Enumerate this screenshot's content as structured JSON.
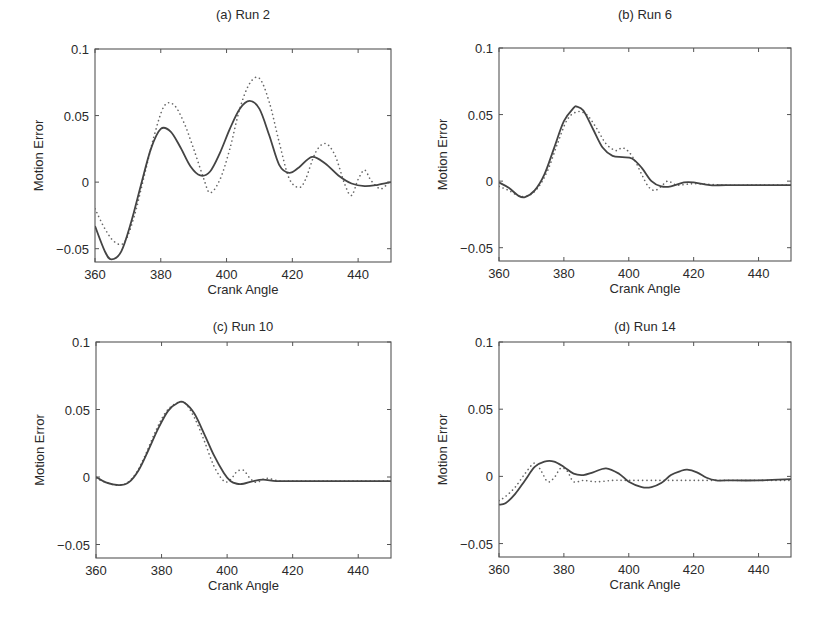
{
  "figure": {
    "panels": [
      {
        "id": "a",
        "title": "(a) Run 2"
      },
      {
        "id": "b",
        "title": "(b) Run 6"
      },
      {
        "id": "c",
        "title": "(c) Run 10"
      },
      {
        "id": "d",
        "title": "(d) Run 14"
      }
    ]
  },
  "chart_data": [
    {
      "type": "line",
      "title": "(a) Run 2",
      "xlabel": "Crank Angle",
      "ylabel": "Motion Error",
      "xlim": [
        360,
        450
      ],
      "ylim": [
        -0.06,
        0.1
      ],
      "xticks": [
        360,
        380,
        400,
        420,
        440
      ],
      "yticks": [
        -0.05,
        0,
        0.05,
        0.1
      ],
      "ytick_labels": [
        "-0.05",
        "0",
        "0.05",
        "0.1"
      ],
      "grid": false,
      "series": [
        {
          "name": "solid",
          "style": "solid",
          "x": [
            360,
            363,
            365,
            368,
            371,
            374,
            377,
            380,
            383,
            386,
            389,
            392,
            395,
            398,
            401,
            404,
            407,
            410,
            413,
            416,
            419,
            422,
            426,
            430,
            434,
            438,
            442,
            446,
            450
          ],
          "y": [
            -0.033,
            -0.052,
            -0.058,
            -0.052,
            -0.03,
            -0.002,
            0.025,
            0.04,
            0.038,
            0.026,
            0.012,
            0.005,
            0.008,
            0.022,
            0.04,
            0.055,
            0.061,
            0.055,
            0.035,
            0.013,
            0.007,
            0.011,
            0.019,
            0.014,
            0.005,
            -0.001,
            -0.003,
            -0.002,
            0.0
          ]
        },
        {
          "name": "dotted",
          "style": "dotted",
          "x": [
            360,
            363,
            366,
            369,
            372,
            375,
            378,
            381,
            384,
            387,
            390,
            393,
            395,
            398,
            401,
            404,
            407,
            410,
            413,
            416,
            419,
            422,
            424,
            427,
            430,
            433,
            436,
            438,
            440,
            442,
            444,
            447,
            450
          ],
          "y": [
            -0.02,
            -0.035,
            -0.045,
            -0.045,
            -0.025,
            0.005,
            0.035,
            0.057,
            0.058,
            0.045,
            0.025,
            0.003,
            -0.008,
            0.002,
            0.025,
            0.055,
            0.074,
            0.078,
            0.06,
            0.03,
            0.003,
            -0.004,
            0.002,
            0.022,
            0.029,
            0.02,
            -0.002,
            -0.01,
            0.002,
            0.009,
            0.001,
            -0.005,
            0.002
          ]
        }
      ]
    },
    {
      "type": "line",
      "title": "(b) Run 6",
      "xlabel": "Crank Angle",
      "ylabel": "Motion Error",
      "xlim": [
        360,
        450
      ],
      "ylim": [
        -0.06,
        0.1
      ],
      "xticks": [
        360,
        380,
        400,
        420,
        440
      ],
      "yticks": [
        -0.05,
        0,
        0.05,
        0.1
      ],
      "ytick_labels": [
        "-0.05",
        "0",
        "0.05",
        "0.1"
      ],
      "grid": false,
      "series": [
        {
          "name": "solid",
          "style": "solid",
          "x": [
            360,
            363,
            366,
            368,
            371,
            374,
            377,
            380,
            383,
            384,
            386,
            389,
            392,
            395,
            398,
            401,
            404,
            407,
            410,
            413,
            417,
            420,
            425,
            430,
            440,
            450
          ],
          "y": [
            -0.001,
            -0.005,
            -0.011,
            -0.012,
            -0.007,
            0.005,
            0.025,
            0.045,
            0.055,
            0.056,
            0.053,
            0.039,
            0.025,
            0.019,
            0.018,
            0.017,
            0.01,
            0.0,
            -0.004,
            -0.004,
            -0.001,
            -0.001,
            -0.003,
            -0.003,
            -0.003,
            -0.003
          ]
        },
        {
          "name": "dotted",
          "style": "dotted",
          "x": [
            360,
            363,
            366,
            369,
            372,
            375,
            378,
            381,
            384,
            387,
            390,
            393,
            396,
            398,
            400,
            402,
            404,
            406,
            408,
            410,
            412,
            415,
            420,
            430,
            440,
            450
          ],
          "y": [
            -0.004,
            -0.007,
            -0.011,
            -0.011,
            -0.005,
            0.008,
            0.028,
            0.046,
            0.052,
            0.05,
            0.04,
            0.028,
            0.023,
            0.025,
            0.022,
            0.015,
            0.005,
            -0.004,
            -0.007,
            -0.004,
            0.0,
            -0.003,
            -0.002,
            -0.003,
            -0.003,
            -0.003
          ]
        }
      ]
    },
    {
      "type": "line",
      "title": "(c) Run 10",
      "xlabel": "Crank Angle",
      "ylabel": "Motion Error",
      "xlim": [
        360,
        450
      ],
      "ylim": [
        -0.06,
        0.1
      ],
      "xticks": [
        360,
        380,
        400,
        420,
        440
      ],
      "yticks": [
        -0.05,
        0,
        0.05,
        0.1
      ],
      "ytick_labels": [
        "-0.05",
        "0",
        "0.05",
        "0.1"
      ],
      "grid": false,
      "series": [
        {
          "name": "solid",
          "style": "solid",
          "x": [
            360,
            363,
            367,
            370,
            373,
            376,
            379,
            382,
            385,
            387,
            390,
            393,
            396,
            399,
            401,
            403,
            405,
            408,
            411,
            415,
            420,
            430,
            440,
            450
          ],
          "y": [
            0.0,
            -0.004,
            -0.006,
            -0.004,
            0.005,
            0.02,
            0.036,
            0.049,
            0.055,
            0.055,
            0.047,
            0.032,
            0.016,
            0.003,
            -0.003,
            -0.005,
            -0.005,
            -0.003,
            -0.002,
            -0.003,
            -0.003,
            -0.003,
            -0.003,
            -0.003
          ]
        },
        {
          "name": "dotted",
          "style": "dotted",
          "x": [
            360,
            363,
            366,
            369,
            372,
            375,
            378,
            381,
            384,
            387,
            390,
            393,
            396,
            399,
            401,
            403,
            405,
            407,
            409,
            412,
            416,
            420,
            430,
            440,
            450
          ],
          "y": [
            -0.001,
            -0.004,
            -0.006,
            -0.005,
            0.002,
            0.016,
            0.033,
            0.047,
            0.054,
            0.055,
            0.044,
            0.027,
            0.008,
            -0.003,
            -0.002,
            0.004,
            0.005,
            -0.001,
            -0.004,
            -0.001,
            -0.003,
            -0.003,
            -0.003,
            -0.003,
            -0.003
          ]
        }
      ]
    },
    {
      "type": "line",
      "title": "(d) Run 14",
      "xlabel": "Crank Angle",
      "ylabel": "Motion Error",
      "xlim": [
        360,
        450
      ],
      "ylim": [
        -0.06,
        0.1
      ],
      "xticks": [
        360,
        380,
        400,
        420,
        440
      ],
      "yticks": [
        -0.05,
        0,
        0.05,
        0.1
      ],
      "ytick_labels": [
        "-0.05",
        "0",
        "0.05",
        "0.1"
      ],
      "grid": false,
      "series": [
        {
          "name": "solid",
          "style": "solid",
          "x": [
            360,
            362,
            365,
            368,
            371,
            374,
            377,
            380,
            383,
            386,
            389,
            393,
            397,
            400,
            404,
            407,
            410,
            413,
            416,
            418,
            421,
            424,
            427,
            430,
            440,
            450
          ],
          "y": [
            -0.021,
            -0.02,
            -0.013,
            -0.003,
            0.007,
            0.011,
            0.011,
            0.007,
            0.002,
            0.001,
            0.003,
            0.006,
            0.002,
            -0.004,
            -0.008,
            -0.008,
            -0.005,
            0.001,
            0.004,
            0.005,
            0.003,
            -0.001,
            -0.003,
            -0.003,
            -0.003,
            -0.002
          ]
        },
        {
          "name": "dotted",
          "style": "dotted",
          "x": [
            360,
            362,
            365,
            368,
            371,
            373,
            375,
            377,
            379,
            381,
            383,
            386,
            390,
            395,
            400,
            410,
            420,
            430,
            440,
            450
          ],
          "y": [
            -0.018,
            -0.015,
            -0.008,
            0.002,
            0.01,
            0.004,
            -0.004,
            -0.001,
            0.006,
            0.004,
            -0.004,
            -0.003,
            -0.004,
            -0.003,
            -0.003,
            -0.003,
            -0.003,
            -0.003,
            -0.003,
            -0.003
          ]
        }
      ]
    }
  ]
}
